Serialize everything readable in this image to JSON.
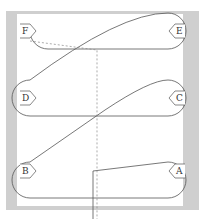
{
  "diagram": {
    "type": "conveyor-path",
    "loops": [
      {
        "id": "top",
        "left_label": "F",
        "right_label": "E"
      },
      {
        "id": "middle",
        "left_label": "D",
        "right_label": "C"
      },
      {
        "id": "bottom",
        "left_label": "B",
        "right_label": "A"
      }
    ],
    "colors": {
      "background": "#cfcfcf",
      "canvas": "#ffffff",
      "line": "#555555",
      "dashed": "#888888"
    }
  }
}
